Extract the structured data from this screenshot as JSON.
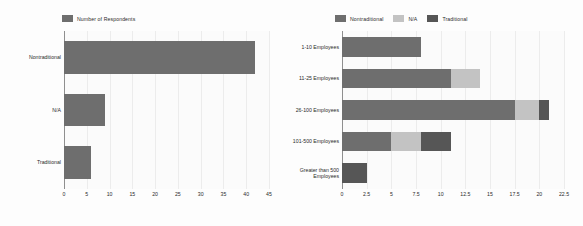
{
  "chart_data": [
    {
      "id": "left",
      "type": "bar",
      "orientation": "horizontal",
      "title": "",
      "xlabel": "",
      "ylabel": "",
      "grid": true,
      "legend_position": "top-left",
      "legend": [
        "Number of Respondents"
      ],
      "colors": {
        "Number of Respondents": "#6e6e6e"
      },
      "categories": [
        "Nontraditional",
        "N/A",
        "Traditional"
      ],
      "series": [
        {
          "name": "Number of Respondents",
          "values": [
            42,
            9,
            6
          ]
        }
      ],
      "xlim": [
        0,
        45
      ],
      "xticks": [
        "0",
        "5",
        "10",
        "15",
        "20",
        "25",
        "30",
        "35",
        "40",
        "45"
      ],
      "xtick_values": [
        0,
        5,
        10,
        15,
        20,
        25,
        30,
        35,
        40,
        45
      ]
    },
    {
      "id": "right",
      "type": "bar",
      "orientation": "horizontal",
      "stacked": true,
      "title": "",
      "xlabel": "",
      "ylabel": "",
      "grid": true,
      "legend_position": "top-center",
      "legend": [
        "Nontraditional",
        "N/A",
        "Traditional"
      ],
      "colors": {
        "Nontraditional": "#6e6e6e",
        "N/A": "#c3c3c3",
        "Traditional": "#565656"
      },
      "categories": [
        "1-10 Employees",
        "11-25 Employees",
        "26-100 Employees",
        "101-500 Employees",
        "Greater than 500\nEmployees"
      ],
      "series": [
        {
          "name": "Nontraditional",
          "values": [
            8,
            11,
            17.5,
            5,
            0
          ]
        },
        {
          "name": "N/A",
          "values": [
            0,
            3,
            2.5,
            3,
            0
          ]
        },
        {
          "name": "Traditional",
          "values": [
            0,
            0,
            1,
            3,
            2.5
          ]
        }
      ],
      "xlim": [
        0,
        22.5
      ],
      "xticks": [
        "0",
        "2.5",
        "5",
        "7.5",
        "10",
        "12.5",
        "15",
        "17.5",
        "20",
        "22.5"
      ],
      "xtick_values": [
        0,
        2.5,
        5,
        7.5,
        10,
        12.5,
        15,
        17.5,
        20,
        22.5
      ]
    }
  ]
}
